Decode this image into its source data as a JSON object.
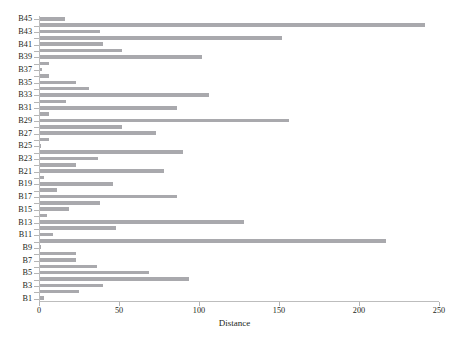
{
  "chart_data": {
    "type": "bar",
    "orientation": "horizontal",
    "title": "",
    "xlabel": "Distance",
    "ylabel": "",
    "xlim": [
      0,
      250
    ],
    "xticks": [
      0,
      50,
      100,
      150,
      200,
      250
    ],
    "xticklabels": [
      "0",
      "50",
      "100",
      "150",
      "200",
      "250"
    ],
    "yticklabels_shown": [
      "B1",
      "B3",
      "B5",
      "B7",
      "B9",
      "B11",
      "B13",
      "B15",
      "B17",
      "B19",
      "B21",
      "B23",
      "B25",
      "B27",
      "B29",
      "B31",
      "B33",
      "B35",
      "B37",
      "B39",
      "B41",
      "B43",
      "B45"
    ],
    "grid": false,
    "legend": null,
    "bar_color": "#a9a9ad",
    "categories": [
      "B1",
      "B2",
      "B3",
      "B4",
      "B5",
      "B6",
      "B7",
      "B8",
      "B9",
      "B10",
      "B11",
      "B12",
      "B13",
      "B14",
      "B15",
      "B16",
      "B17",
      "B18",
      "B19",
      "B20",
      "B21",
      "B22",
      "B23",
      "B24",
      "B25",
      "B26",
      "B27",
      "B28",
      "B29",
      "B30",
      "B31",
      "B32",
      "B33",
      "B34",
      "B35",
      "B36",
      "B37",
      "B38",
      "B39",
      "B40",
      "B41",
      "B42",
      "B43",
      "B44",
      "B45"
    ],
    "values": [
      3,
      25,
      40,
      94,
      69,
      36,
      23,
      23,
      1,
      217,
      9,
      48,
      128,
      5,
      19,
      38,
      86,
      11,
      46,
      3,
      78,
      23,
      37,
      90,
      1,
      6,
      73,
      52,
      156,
      6,
      86,
      17,
      106,
      31,
      23,
      6,
      2,
      6,
      102,
      52,
      40,
      152,
      38,
      241,
      16
    ]
  },
  "axis": {
    "x_title": "Distance"
  }
}
